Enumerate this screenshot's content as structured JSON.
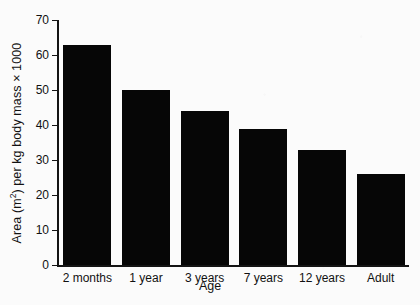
{
  "chart_data": {
    "type": "bar",
    "title": "",
    "categories": [
      "2 months",
      "1 year",
      "3 years",
      "7 years",
      "12 years",
      "Adult"
    ],
    "values": [
      63,
      50,
      44,
      39,
      33,
      26
    ],
    "xlabel": "Age",
    "ylabel_parts": {
      "before": "Area (m",
      "superscript": "2",
      "after": ") per kg body mass × 1000"
    },
    "ylabel": "Area (m2) per kg body mass × 1000",
    "ylim": [
      0,
      70
    ],
    "ytick_labels": [
      "0",
      "10",
      "20",
      "30",
      "40",
      "50",
      "60",
      "70"
    ],
    "ytick_values": [
      0,
      10,
      20,
      30,
      40,
      50,
      60,
      70
    ],
    "grid": false,
    "legend": false,
    "bar_color": "#060606",
    "background_color": "#fbfbfb",
    "axis_color": "#141414"
  }
}
